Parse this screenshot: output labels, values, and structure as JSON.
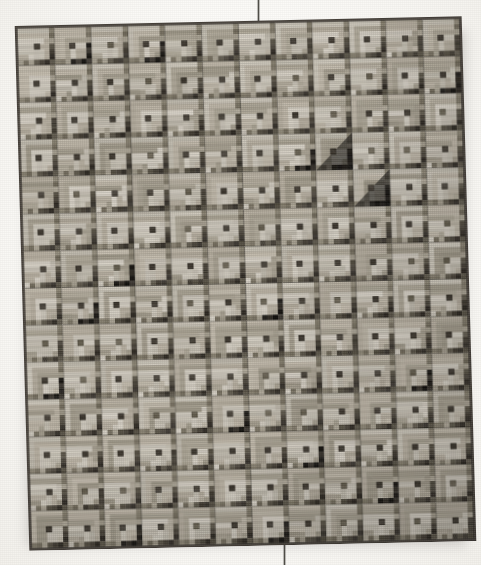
{
  "photo": {
    "subject": "Log Cabin quilt",
    "background_color": "#fbfaf7",
    "title": "Log Cabin quilt photographed hanging against a plain light background"
  },
  "quilt": {
    "pattern_name": "Log Cabin",
    "block_rows": 14,
    "block_columns": 12,
    "block_size_px": 37.3,
    "border_color": "#4c463f",
    "tilt_degrees": -1.6,
    "palette": {
      "light_1": "#c9c3b6",
      "light_2": "#bdb5a6",
      "light_3": "#aaa393",
      "light_4": "#d3cdc1",
      "mid_1": "#8d8675",
      "mid_2": "#7b7464",
      "dark_1": "#5b5548",
      "dark_2": "#4a443a",
      "dark_3": "#36312a",
      "black": "#1d1a16",
      "center_dark": "#423c33",
      "center_mid": "#6b6454"
    },
    "block_orientations": [
      "light-upper-left",
      "light-lower-right"
    ],
    "fabric_effects": [
      "plain",
      "polka-dot",
      "fine-stripe",
      "checked",
      "speckled"
    ]
  },
  "hardware": {
    "top_wire": {
      "label": "hanging-wire-top",
      "color": "#6d6a63"
    },
    "bottom_wire": {
      "label": "hanging-wire-bottom",
      "color": "#78756e"
    }
  },
  "blocks": {
    "comment": "grid of 14 rows x 12 columns; v = 0 plain light block, 1 has a dark/black wedge, 2 has a strongly patterned (dotted or striped) wedge, 3 is a very dark block",
    "grid": [
      [
        0,
        1,
        0,
        1,
        0,
        0,
        0,
        2,
        0,
        0,
        2,
        2
      ],
      [
        0,
        0,
        0,
        0,
        0,
        0,
        0,
        0,
        0,
        0,
        0,
        1
      ],
      [
        2,
        0,
        0,
        0,
        0,
        0,
        0,
        0,
        0,
        0,
        0,
        0
      ],
      [
        0,
        0,
        0,
        0,
        0,
        0,
        0,
        1,
        3,
        0,
        0,
        0
      ],
      [
        0,
        0,
        0,
        0,
        2,
        0,
        0,
        0,
        0,
        3,
        0,
        0
      ],
      [
        0,
        0,
        0,
        0,
        0,
        0,
        2,
        0,
        0,
        0,
        0,
        0
      ],
      [
        0,
        0,
        1,
        0,
        2,
        0,
        0,
        0,
        0,
        0,
        0,
        0
      ],
      [
        0,
        1,
        0,
        0,
        0,
        0,
        1,
        0,
        0,
        0,
        0,
        0
      ],
      [
        2,
        0,
        0,
        0,
        0,
        0,
        0,
        0,
        2,
        0,
        0,
        0
      ],
      [
        1,
        0,
        0,
        0,
        0,
        0,
        0,
        0,
        0,
        0,
        1,
        0
      ],
      [
        0,
        0,
        0,
        0,
        0,
        1,
        0,
        0,
        0,
        0,
        0,
        0
      ],
      [
        0,
        0,
        0,
        2,
        0,
        0,
        0,
        1,
        0,
        0,
        0,
        0
      ],
      [
        0,
        2,
        0,
        0,
        0,
        0,
        0,
        0,
        0,
        1,
        0,
        0
      ],
      [
        0,
        0,
        1,
        0,
        0,
        0,
        1,
        0,
        0,
        0,
        0,
        2
      ]
    ]
  }
}
